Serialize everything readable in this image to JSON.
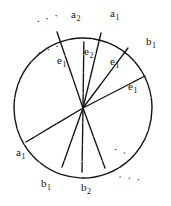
{
  "figure": {
    "type": "circle-sector-diagram",
    "width": 171,
    "height": 206,
    "background_color": "#ffffff",
    "ink_color": "#15130f",
    "circle": {
      "center_x": 83,
      "center_y": 108,
      "radius_x": 69,
      "radius_y": 70,
      "stroke_width": 1.4
    },
    "chords": [
      {
        "name": "chord-to-top-left",
        "angle_deg": 104,
        "end_x": 57,
        "end_y": 32
      },
      {
        "name": "chord-to-top",
        "angle_deg": 88,
        "end_x": 84,
        "end_y": 31,
        "style": "dashed"
      },
      {
        "name": "chord-to-top-right",
        "angle_deg": 73,
        "end_x": 101,
        "end_y": 33
      },
      {
        "name": "chord-to-upper-right",
        "angle_deg": 50,
        "end_x": 128,
        "end_y": 48
      },
      {
        "name": "chord-to-right",
        "angle_deg": 26,
        "end_x": 145,
        "end_y": 76
      },
      {
        "name": "chord-to-lower-left",
        "angle_deg": 209,
        "end_x": 26,
        "end_y": 142
      },
      {
        "name": "chord-to-bottom-left",
        "angle_deg": 253,
        "end_x": 62,
        "end_y": 167
      },
      {
        "name": "chord-to-bottom",
        "angle_deg": 268,
        "end_x": 82,
        "end_y": 172,
        "style": "dashed"
      },
      {
        "name": "chord-to-bottom-right",
        "angle_deg": 287,
        "end_x": 105,
        "end_y": 168
      }
    ]
  },
  "labels": [
    {
      "id": "a2-top",
      "base": "a",
      "sub": "2",
      "x": 71,
      "y": 9
    },
    {
      "id": "a1-topright",
      "base": "a",
      "sub": "1",
      "x": 110,
      "y": 8
    },
    {
      "id": "b1-right",
      "base": "b",
      "sub": "1",
      "x": 146,
      "y": 36
    },
    {
      "id": "e2-inner-top",
      "base": "e",
      "sub": "2",
      "x": 84,
      "y": 46
    },
    {
      "id": "e1-inner-upper-right",
      "base": "e",
      "sub": "1",
      "x": 110,
      "y": 56
    },
    {
      "id": "e1-inner-right",
      "base": "e",
      "sub": "1",
      "x": 128,
      "y": 81
    },
    {
      "id": "e1-inner-upper-left",
      "base": "e",
      "sub": "1",
      "x": 57,
      "y": 55
    },
    {
      "id": "a1-left",
      "base": "a",
      "sub": "1",
      "x": 16,
      "y": 147
    },
    {
      "id": "b1-bottom",
      "base": "b",
      "sub": "1",
      "x": 41,
      "y": 178
    },
    {
      "id": "b2-bottom",
      "base": "b",
      "sub": "2",
      "x": 81,
      "y": 182
    }
  ],
  "ellipses": [
    {
      "id": "ellipsis-outside-top-left",
      "text": "· · ·",
      "x": 36,
      "y": 13,
      "rotate": -18
    },
    {
      "id": "ellipsis-inside-upper-left",
      "text": "· · ·",
      "x": 37,
      "y": 44,
      "rotate": -20
    },
    {
      "id": "ellipsis-inside-lower-right",
      "text": "· · ·",
      "x": 113,
      "y": 148,
      "rotate": 22
    },
    {
      "id": "ellipsis-outside-bottom-right",
      "text": "· · ·",
      "x": 118,
      "y": 173,
      "rotate": 8
    }
  ]
}
